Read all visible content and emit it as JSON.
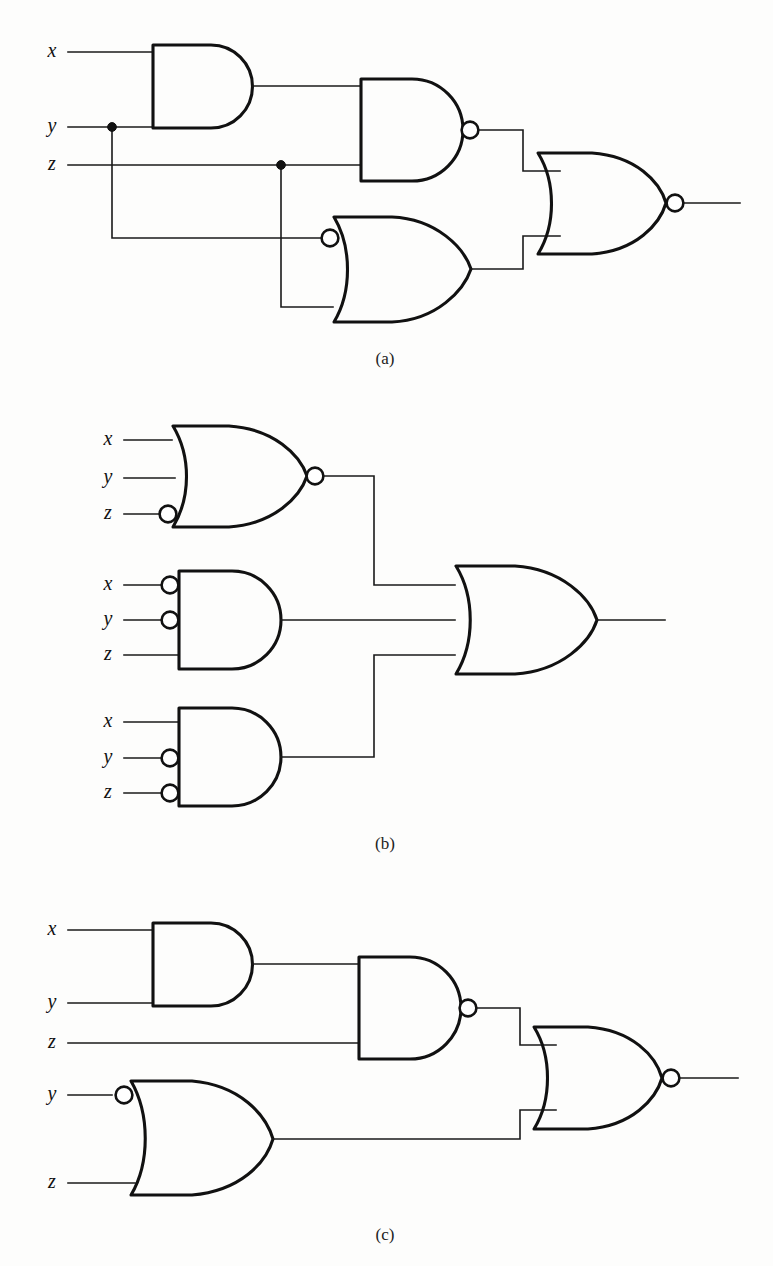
{
  "figure": {
    "panels": [
      {
        "id": "a",
        "label": "(a)",
        "label_x": 385,
        "label_y": 360,
        "inputs": [
          {
            "name": "x",
            "label": "x",
            "x": 52,
            "y": 52
          },
          {
            "name": "y",
            "label": "y",
            "x": 52,
            "y": 127
          },
          {
            "name": "z",
            "label": "z",
            "x": 52,
            "y": 165
          }
        ],
        "gates": [
          {
            "name": "and-gate-xy",
            "type": "AND",
            "inputs": 2,
            "output_bubble": false,
            "input_bubbles": []
          },
          {
            "name": "nand-gate-mid",
            "type": "NAND",
            "inputs": 2,
            "output_bubble": true,
            "input_bubbles": []
          },
          {
            "name": "or-gate-inverted-top",
            "type": "OR",
            "inputs": 2,
            "output_bubble": false,
            "input_bubbles": [
              0
            ]
          },
          {
            "name": "nor-gate-output",
            "type": "NOR",
            "inputs": 2,
            "output_bubble": true,
            "input_bubbles": []
          }
        ],
        "junctions": [
          {
            "name": "junction-y",
            "x": 112,
            "y": 127
          },
          {
            "name": "junction-z",
            "x": 281,
            "y": 165
          }
        ]
      },
      {
        "id": "b",
        "label": "(b)",
        "label_x": 385,
        "label_y": 845,
        "inputs": [
          {
            "name": "x",
            "label": "x",
            "x": 108,
            "y": 440
          },
          {
            "name": "y",
            "label": "y",
            "x": 108,
            "y": 478
          },
          {
            "name": "z",
            "label": "z",
            "x": 108,
            "y": 514
          },
          {
            "name": "x",
            "label": "x",
            "x": 108,
            "y": 585
          },
          {
            "name": "y",
            "label": "y",
            "x": 108,
            "y": 620
          },
          {
            "name": "z",
            "label": "z",
            "x": 108,
            "y": 655
          },
          {
            "name": "x",
            "label": "x",
            "x": 108,
            "y": 722
          },
          {
            "name": "y",
            "label": "y",
            "x": 108,
            "y": 758
          },
          {
            "name": "z",
            "label": "z",
            "x": 108,
            "y": 793
          }
        ],
        "gates": [
          {
            "name": "nor-gate-xyz",
            "type": "NOR",
            "inputs": 3,
            "output_bubble": true,
            "input_bubbles": [
              2
            ]
          },
          {
            "name": "and-gate-nx-ny-z",
            "type": "AND",
            "inputs": 3,
            "output_bubble": false,
            "input_bubbles": [
              0,
              1
            ]
          },
          {
            "name": "and-gate-x-ny-nz",
            "type": "AND",
            "inputs": 3,
            "output_bubble": false,
            "input_bubbles": [
              1,
              2
            ]
          },
          {
            "name": "or-gate-output",
            "type": "OR",
            "inputs": 3,
            "output_bubble": false,
            "input_bubbles": []
          }
        ],
        "junctions": []
      },
      {
        "id": "c",
        "label": "(c)",
        "label_x": 385,
        "label_y": 1236,
        "inputs": [
          {
            "name": "x",
            "label": "x",
            "x": 52,
            "y": 930
          },
          {
            "name": "y",
            "label": "y",
            "x": 52,
            "y": 1003
          },
          {
            "name": "z",
            "label": "z",
            "x": 52,
            "y": 1043
          },
          {
            "name": "y",
            "label": "y",
            "x": 52,
            "y": 1095
          },
          {
            "name": "z",
            "label": "z",
            "x": 52,
            "y": 1183
          }
        ],
        "gates": [
          {
            "name": "and-gate-xy",
            "type": "AND",
            "inputs": 2,
            "output_bubble": false,
            "input_bubbles": []
          },
          {
            "name": "nand-gate-mid",
            "type": "NAND",
            "inputs": 2,
            "output_bubble": true,
            "input_bubbles": []
          },
          {
            "name": "or-gate-inverted-y",
            "type": "OR",
            "inputs": 2,
            "output_bubble": false,
            "input_bubbles": [
              0
            ]
          },
          {
            "name": "nor-gate-output",
            "type": "NOR",
            "inputs": 2,
            "output_bubble": true,
            "input_bubbles": []
          }
        ],
        "junctions": []
      }
    ],
    "colors": {
      "ink": "#111111",
      "wire": "#1a1a1a",
      "background": "#fdfdfc"
    }
  }
}
